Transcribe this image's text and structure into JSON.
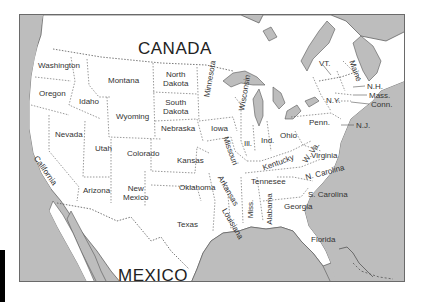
{
  "map": {
    "title": "United States outline map",
    "colors": {
      "water": "#bdbdbd",
      "land": "#ffffff",
      "border": "#555555",
      "frame": "#6a6a6a"
    },
    "regions": {
      "canada": "CANADA",
      "mexico": "MEXICO"
    },
    "states": [
      {
        "id": "washington",
        "label": "Washington",
        "x": 37,
        "y": 62
      },
      {
        "id": "oregon",
        "label": "Oregon",
        "x": 38,
        "y": 90
      },
      {
        "id": "idaho",
        "label": "Idaho",
        "x": 78,
        "y": 97
      },
      {
        "id": "montana",
        "label": "Montana",
        "x": 108,
        "y": 76
      },
      {
        "id": "wyoming",
        "label": "Wyoming",
        "x": 116,
        "y": 112
      },
      {
        "id": "north-dakota",
        "label": "North\nDakota",
        "x": 163,
        "y": 70
      },
      {
        "id": "south-dakota",
        "label": "South\nDakota",
        "x": 163,
        "y": 99
      },
      {
        "id": "minnesota",
        "label": "Minnesota",
        "x": 205,
        "y": 68,
        "rotate": -80
      },
      {
        "id": "nebraska",
        "label": "Nebraska",
        "x": 160,
        "y": 124
      },
      {
        "id": "iowa",
        "label": "Iowa",
        "x": 210,
        "y": 124
      },
      {
        "id": "wisconsin",
        "label": "Wisconsin",
        "x": 240,
        "y": 82,
        "rotate": -80
      },
      {
        "id": "nevada",
        "label": "Nevada",
        "x": 54,
        "y": 130
      },
      {
        "id": "utah",
        "label": "Utah",
        "x": 94,
        "y": 143
      },
      {
        "id": "colorado",
        "label": "Colorado",
        "x": 126,
        "y": 148
      },
      {
        "id": "kansas",
        "label": "Kansas",
        "x": 175,
        "y": 155
      },
      {
        "id": "missouri",
        "label": "Missouri",
        "x": 221,
        "y": 148,
        "rotate": 70
      },
      {
        "id": "illinois",
        "label": "Ill.",
        "x": 243,
        "y": 139
      },
      {
        "id": "indiana",
        "label": "Ind.",
        "x": 261,
        "y": 136
      },
      {
        "id": "ohio",
        "label": "Ohio",
        "x": 280,
        "y": 131
      },
      {
        "id": "michigan",
        "label": "",
        "x": 0,
        "y": 0
      },
      {
        "id": "california",
        "label": "California",
        "x": 36,
        "y": 160,
        "rotate": 55
      },
      {
        "id": "arizona",
        "label": "Arizona",
        "x": 83,
        "y": 186
      },
      {
        "id": "new-mexico",
        "label": "New\nMexico",
        "x": 123,
        "y": 183
      },
      {
        "id": "oklahoma",
        "label": "Oklahoma",
        "x": 178,
        "y": 182
      },
      {
        "id": "texas",
        "label": "Texas",
        "x": 176,
        "y": 220
      },
      {
        "id": "arkansas",
        "label": "Arkansas",
        "x": 217,
        "y": 183,
        "rotate": 60
      },
      {
        "id": "louisiana",
        "label": "Louisiana",
        "x": 222,
        "y": 213,
        "rotate": 60
      },
      {
        "id": "mississippi",
        "label": "Miss.",
        "x": 247,
        "y": 200,
        "rotate": -90
      },
      {
        "id": "alabama",
        "label": "Alabama",
        "x": 264,
        "y": 198,
        "rotate": -90
      },
      {
        "id": "georgia",
        "label": "Georgia",
        "x": 284,
        "y": 202
      },
      {
        "id": "tennessee",
        "label": "Tennesee",
        "x": 250,
        "y": 177
      },
      {
        "id": "kentucky",
        "label": "Kentucky",
        "x": 262,
        "y": 158,
        "rotate": -20
      },
      {
        "id": "west-virginia",
        "label": "W. Va.",
        "x": 298,
        "y": 146,
        "rotate": -55
      },
      {
        "id": "virginia",
        "label": "Virginia",
        "x": 310,
        "y": 150
      },
      {
        "id": "north-carolina",
        "label": "N. Carolina",
        "x": 304,
        "y": 166,
        "rotate": -15
      },
      {
        "id": "south-carolina",
        "label": "S. Carolina",
        "x": 307,
        "y": 190
      },
      {
        "id": "florida",
        "label": "Florida",
        "x": 310,
        "y": 235
      },
      {
        "id": "pennsylvania",
        "label": "Penn.",
        "x": 308,
        "y": 118
      },
      {
        "id": "new-york",
        "label": "N.Y.",
        "x": 325,
        "y": 96
      },
      {
        "id": "vermont",
        "label": "VT.",
        "x": 318,
        "y": 58
      },
      {
        "id": "maine",
        "label": "Maine",
        "x": 349,
        "y": 62,
        "rotate": 70
      },
      {
        "id": "new-hampshire",
        "label": "N.H.",
        "x": 366,
        "y": 82
      },
      {
        "id": "massachusetts",
        "label": "Mass.",
        "x": 368,
        "y": 91
      },
      {
        "id": "connecticut",
        "label": "Conn.",
        "x": 370,
        "y": 100
      },
      {
        "id": "new-jersey",
        "label": "N.J.",
        "x": 355,
        "y": 121
      }
    ]
  }
}
